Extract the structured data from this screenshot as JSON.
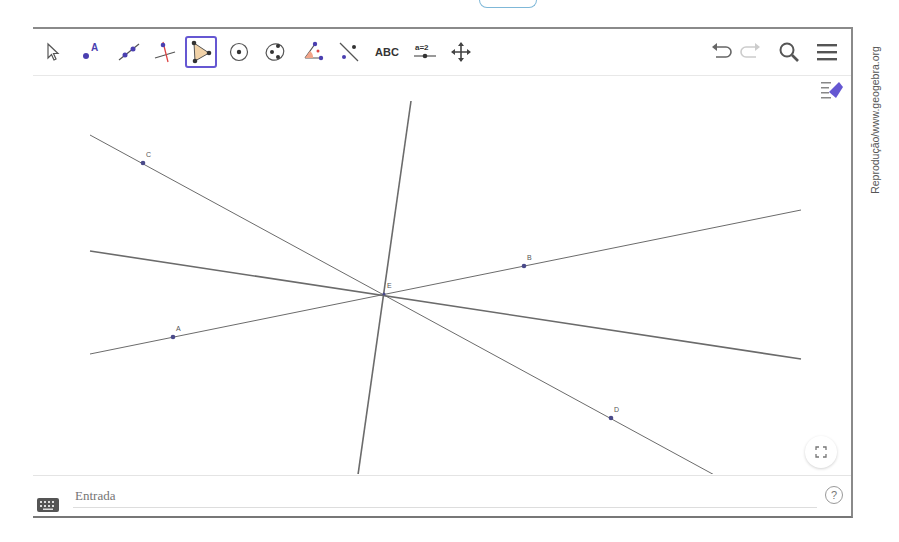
{
  "app": {
    "name": "GeoGebra",
    "credit": "Reprodução/www.geogebra.org"
  },
  "toolbar": {
    "tools": [
      {
        "id": "move",
        "label": "Move"
      },
      {
        "id": "point",
        "label": "Point",
        "glyph": "A"
      },
      {
        "id": "line",
        "label": "Line"
      },
      {
        "id": "perpendicular-line",
        "label": "Perpendicular Line"
      },
      {
        "id": "polygon",
        "label": "Polygon",
        "active": true
      },
      {
        "id": "circle-center-point",
        "label": "Circle with Center through Point"
      },
      {
        "id": "ellipse",
        "label": "Ellipse"
      },
      {
        "id": "angle",
        "label": "Angle"
      },
      {
        "id": "reflect",
        "label": "Reflect about Line"
      },
      {
        "id": "text",
        "label": "ABC"
      },
      {
        "id": "slider",
        "label": "a=2"
      },
      {
        "id": "move-graphics-view",
        "label": "Move Graphics View"
      }
    ],
    "right": {
      "undo": "Undo",
      "redo": "Redo",
      "search": "Search",
      "menu": "Menu"
    },
    "active_color": "#6557d2"
  },
  "canvas": {
    "point_color": "#4a4a8a",
    "line_color": "#6b6b6b",
    "intersection": {
      "label": "E",
      "x": 351,
      "y": 218
    },
    "points": [
      {
        "label": "C",
        "x": 110,
        "y": 87
      },
      {
        "label": "B",
        "x": 491,
        "y": 190
      },
      {
        "label": "A",
        "x": 140,
        "y": 261
      },
      {
        "label": "D",
        "x": 578,
        "y": 342
      }
    ],
    "lines": [
      {
        "name": "line-through-C-D",
        "x1": 57,
        "y1": 59,
        "x2": 731,
        "y2": 426,
        "width": 1
      },
      {
        "name": "line-through-A-B",
        "x1": 57,
        "y1": 278,
        "x2": 768,
        "y2": 134,
        "width": 1
      },
      {
        "name": "bisector-1",
        "x1": 57,
        "y1": 175,
        "x2": 768,
        "y2": 283,
        "width": 1.6
      },
      {
        "name": "bisector-2",
        "x1": 378,
        "y1": 25,
        "x2": 321,
        "y2": 427,
        "width": 1.6
      }
    ]
  },
  "input_bar": {
    "placeholder": "Entrada",
    "help": "?"
  }
}
